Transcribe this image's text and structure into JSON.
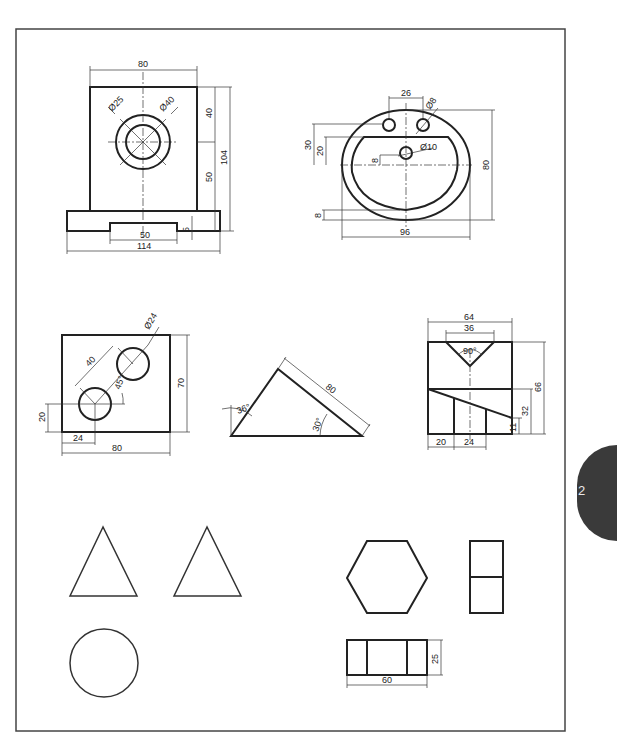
{
  "page": {
    "tab_label": "2",
    "tab_color": "#3a3a3a",
    "line_color": "#222222"
  },
  "drawings": {
    "bracket": {
      "dim_width_top": "80",
      "dim_hole_outer": "Ø25",
      "dim_hole_inner": "Ø40",
      "dim_upper": "40",
      "dim_lower": "50",
      "dim_total_height": "104",
      "dim_slot_width": "50",
      "dim_slot_depth": "5",
      "dim_base_width": "114"
    },
    "washbasin": {
      "dim_tap_spacing": "26",
      "dim_tap_hole": "Ø8",
      "dim_drain": "Ø10",
      "dim_30": "30",
      "dim_20": "20",
      "dim_8_center": "8",
      "dim_height": "80",
      "dim_8_bottom": "8",
      "dim_width": "96"
    },
    "plate_holes": {
      "dim_hole_dia": "Ø24",
      "dim_spacing": "40",
      "dim_angle": "45°",
      "dim_height": "70",
      "dim_y_offset": "20",
      "dim_x_offset": "24",
      "dim_width": "80"
    },
    "triangle": {
      "dim_angle_left": "36°",
      "dim_hyp": "80",
      "dim_angle_right": "30°"
    },
    "vblock": {
      "dim_width": "64",
      "dim_v_width": "36",
      "dim_v_angle": "90°",
      "dim_height": "66",
      "dim_mid": "32",
      "dim_low": "11",
      "dim_x1": "20",
      "dim_x2": "24"
    },
    "hex_block": {
      "dim_height": "25",
      "dim_width": "60"
    }
  }
}
